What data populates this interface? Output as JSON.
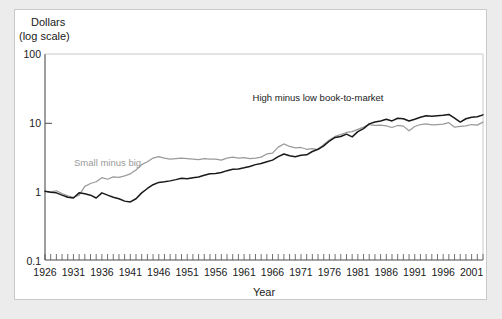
{
  "figure": {
    "background_color": "#ffffff",
    "page_background_color": "#ececed",
    "border_color": "#c9c9cb"
  },
  "chart_data": {
    "type": "line",
    "title": "",
    "subtitle": "",
    "ylabel_line1": "Dollars",
    "ylabel_line2": "(log scale)",
    "xlabel": "Year",
    "yscale": "log",
    "ylim": [
      0.1,
      100
    ],
    "ytick_labels": [
      "100",
      "10",
      "1",
      "0.1"
    ],
    "ytick_values": [
      100,
      10,
      1,
      0.1
    ],
    "xlim": [
      1926,
      2003
    ],
    "xtick_labels": [
      "1926",
      "1931",
      "1936",
      "1941",
      "1946",
      "1951",
      "1956",
      "1961",
      "1966",
      "1971",
      "1976",
      "1981",
      "1986",
      "1991",
      "1996",
      "2001"
    ],
    "xtick_values": [
      1926,
      1931,
      1936,
      1941,
      1946,
      1951,
      1956,
      1961,
      1966,
      1971,
      1976,
      1981,
      1986,
      1991,
      1996,
      2001
    ],
    "minor_ticks": "annual",
    "grid": false,
    "legend_position": "inline-annotation",
    "series": [
      {
        "name": "Small minus big",
        "color": "#9a9a9a",
        "label_x": 1937,
        "label_y": 2.35,
        "x": [
          1926,
          1927,
          1928,
          1929,
          1930,
          1931,
          1932,
          1933,
          1934,
          1935,
          1936,
          1937,
          1938,
          1939,
          1940,
          1941,
          1942,
          1943,
          1944,
          1945,
          1946,
          1947,
          1948,
          1949,
          1950,
          1951,
          1952,
          1953,
          1954,
          1955,
          1956,
          1957,
          1958,
          1959,
          1960,
          1961,
          1962,
          1963,
          1964,
          1965,
          1966,
          1967,
          1968,
          1969,
          1970,
          1971,
          1972,
          1973,
          1974,
          1975,
          1976,
          1977,
          1978,
          1979,
          1980,
          1981,
          1982,
          1983,
          1984,
          1985,
          1986,
          1987,
          1988,
          1989,
          1990,
          1991,
          1992,
          1993,
          1994,
          1995,
          1996,
          1997,
          1998,
          1999,
          2000,
          2001,
          2002,
          2003
        ],
        "y": [
          1.0,
          0.98,
          1.02,
          0.93,
          0.86,
          0.82,
          0.88,
          1.18,
          1.3,
          1.38,
          1.58,
          1.5,
          1.62,
          1.6,
          1.68,
          1.8,
          2.05,
          2.45,
          2.7,
          3.05,
          3.2,
          3.05,
          2.95,
          3.0,
          3.05,
          3.0,
          2.95,
          2.9,
          3.0,
          2.95,
          2.95,
          2.85,
          3.05,
          3.15,
          3.05,
          3.1,
          3.0,
          3.05,
          3.15,
          3.5,
          3.6,
          4.4,
          4.9,
          4.5,
          4.3,
          4.35,
          4.1,
          4.2,
          4.05,
          4.8,
          5.6,
          6.3,
          6.7,
          7.2,
          7.4,
          8.0,
          8.6,
          9.4,
          9.1,
          9.2,
          9.0,
          8.5,
          9.1,
          8.9,
          7.6,
          8.8,
          9.4,
          9.6,
          9.3,
          9.4,
          9.5,
          10.0,
          8.6,
          8.8,
          9.0,
          9.4,
          9.2,
          10.2
        ]
      },
      {
        "name": "High minus low book-to-market",
        "color": "#1a1a1a",
        "label_x": 1974,
        "label_y": 21.0,
        "x": [
          1926,
          1927,
          1928,
          1929,
          1930,
          1931,
          1932,
          1933,
          1934,
          1935,
          1936,
          1937,
          1938,
          1939,
          1940,
          1941,
          1942,
          1943,
          1944,
          1945,
          1946,
          1947,
          1948,
          1949,
          1950,
          1951,
          1952,
          1953,
          1954,
          1955,
          1956,
          1957,
          1958,
          1959,
          1960,
          1961,
          1962,
          1963,
          1964,
          1965,
          1966,
          1967,
          1968,
          1969,
          1970,
          1971,
          1972,
          1973,
          1974,
          1975,
          1976,
          1977,
          1978,
          1979,
          1980,
          1981,
          1982,
          1983,
          1984,
          1985,
          1986,
          1987,
          1988,
          1989,
          1990,
          1991,
          1992,
          1993,
          1994,
          1995,
          1996,
          1997,
          1998,
          1999,
          2000,
          2001,
          2002,
          2003
        ],
        "y": [
          1.0,
          0.97,
          0.95,
          0.88,
          0.82,
          0.8,
          0.95,
          0.92,
          0.88,
          0.8,
          0.95,
          0.88,
          0.82,
          0.78,
          0.72,
          0.7,
          0.78,
          0.95,
          1.1,
          1.25,
          1.35,
          1.38,
          1.42,
          1.48,
          1.55,
          1.52,
          1.58,
          1.62,
          1.72,
          1.8,
          1.82,
          1.88,
          2.0,
          2.1,
          2.12,
          2.2,
          2.3,
          2.45,
          2.55,
          2.7,
          2.85,
          3.2,
          3.5,
          3.3,
          3.2,
          3.35,
          3.4,
          3.8,
          4.1,
          4.6,
          5.4,
          6.1,
          6.3,
          6.8,
          6.2,
          7.4,
          8.2,
          9.6,
          10.2,
          10.6,
          11.2,
          10.6,
          11.6,
          11.4,
          10.6,
          11.2,
          12.0,
          12.6,
          12.4,
          12.6,
          12.8,
          13.2,
          11.6,
          10.2,
          11.4,
          12.0,
          12.2,
          13.0
        ]
      }
    ]
  }
}
